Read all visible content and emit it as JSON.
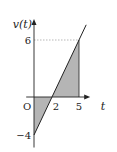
{
  "chart_data": {
    "type": "line",
    "title": "",
    "xlabel": "t",
    "ylabel": "v(t)",
    "origin_label": "O",
    "x_ticks": [
      {
        "value": 2,
        "label": "2"
      },
      {
        "value": 5,
        "label": "5"
      }
    ],
    "y_ticks": [
      {
        "value": 6,
        "label": "6"
      },
      {
        "value": -4,
        "label": "−4"
      }
    ],
    "series": [
      {
        "name": "v(t)",
        "x": [
          0,
          5.8
        ],
        "y": [
          -4,
          7.6
        ]
      }
    ],
    "shaded_regions": [
      {
        "from_x": 0,
        "to_x": 2,
        "note": "between line and t-axis (below)"
      },
      {
        "from_x": 2,
        "to_x": 5,
        "note": "between line and t-axis (above)"
      }
    ],
    "guide_lines": [
      {
        "type": "horizontal-dashed",
        "y": 6,
        "from_x": 0,
        "to_x": 5
      },
      {
        "type": "vertical",
        "x": 5,
        "from_y": 0,
        "to_y": 6
      }
    ],
    "xlim": [
      -1.2,
      5.8
    ],
    "ylim": [
      -5,
      8
    ],
    "colors": {
      "shade": "#b5b5b5",
      "line": "#222222",
      "dashed": "#999999"
    }
  }
}
